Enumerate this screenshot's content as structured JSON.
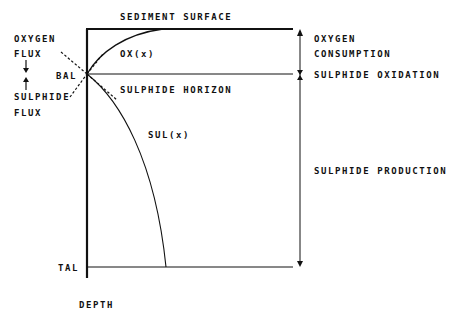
{
  "labels": {
    "sediment_surface": "SEDIMENT SURFACE",
    "oxygen_flux_line1": "OXYGEN",
    "oxygen_flux_line2": "FLUX",
    "sulphide_flux_line1": "SULPHIDE",
    "sulphide_flux_line2": "FLUX",
    "bal": "BAL",
    "tal": "TAL",
    "depth": "DEPTH",
    "ox_curve": "OX(x)",
    "sul_curve": "SUL(x)",
    "sulphide_horizon": "SULPHIDE HORIZON",
    "oxygen_consumption_line1": "OXYGEN",
    "oxygen_consumption_line2": "CONSUMPTION",
    "sulphide_oxidation": "SULPHIDE OXIDATION",
    "sulphide_production": "SULPHIDE PRODUCTION"
  },
  "colors": {
    "ink": "#111111",
    "background": "#ffffff"
  }
}
